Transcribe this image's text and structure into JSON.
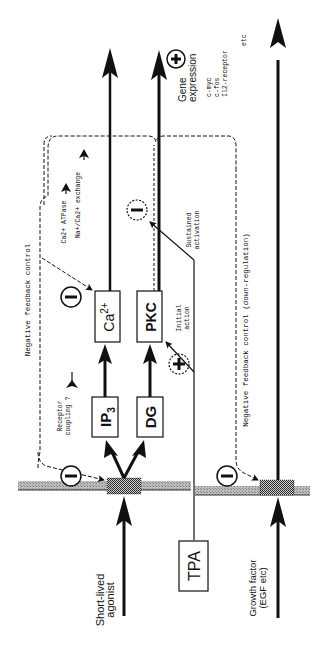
{
  "diagram": {
    "orientation": "rotated-90-ccw",
    "colors": {
      "ink": "#111111",
      "membrane": "#9a9a9a",
      "receptor": "#555555",
      "background": "#ffffff"
    },
    "inputs": {
      "short_lived_agonist": {
        "line1": "Short-lived",
        "line2": "agonist"
      },
      "tpa": "TPA",
      "growth_factor": {
        "line1": "Growth factor",
        "line2": "(EGF etc)"
      }
    },
    "nodes": {
      "ip3": "IP",
      "ip3_sub": "3",
      "dg": "DG",
      "ca": "Ca",
      "ca_sup": "2+",
      "pkc": "PKC"
    },
    "labels": {
      "receptor_coupling": {
        "line1": "Receptor",
        "line2": "coupling ?"
      },
      "negative_feedback": "Negative feedback control",
      "negative_feedback_down": "Negative feedback control (down-regulation)",
      "ca_atpase": "Ca2+ ATPase",
      "na_ca_exchange": "Na+/Ca2+ exchange",
      "initial_action": {
        "line1": "Initial",
        "line2": "action"
      },
      "sustained_activation": {
        "line1": "Sustained",
        "line2": "activation"
      },
      "gene_expression": {
        "title1": "Gene",
        "title2": "expression",
        "items": [
          "c-myc",
          "c-fos",
          "Il2-receptor",
          "etc"
        ]
      }
    },
    "symbols": {
      "minus": "−",
      "plus": "+"
    }
  }
}
